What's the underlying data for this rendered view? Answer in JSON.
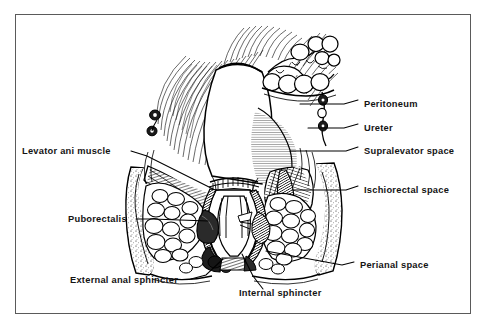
{
  "figure": {
    "border_color": "#5a5a5a",
    "background_color": "#ffffff",
    "ink_color": "#000000"
  },
  "labels": {
    "peritoneum": "Peritoneum",
    "ureter": "Ureter",
    "supralevator_space": "Supralevator space",
    "ischiorectal_space": "Ischiorectal  space",
    "perianal_space": "Perianal space",
    "levator_ani_muscle": "Levator ani muscle",
    "puborectalis": "Puborectalis",
    "external_anal_sphincter": "External anal sphincter",
    "internal_sphincter": "Internal sphincter"
  },
  "label_layout": [
    {
      "key": "peritoneum",
      "side": "right",
      "text_x": 364,
      "text_y": 103,
      "leader": "M 358 100 L 344 104 L 300 104"
    },
    {
      "key": "ureter",
      "side": "right",
      "text_x": 364,
      "text_y": 127,
      "leader": "M 358 124 L 344 128 L 306 128"
    },
    {
      "key": "supralevator_space",
      "side": "right",
      "text_x": 364,
      "text_y": 150,
      "leader": "M 358 147 L 346 151 L 291 151"
    },
    {
      "key": "ischiorectal_space",
      "side": "right",
      "text_x": 364,
      "text_y": 189,
      "leader": "M 358 186 L 346 190 L 293 190"
    },
    {
      "key": "perianal_space",
      "side": "right",
      "text_x": 360,
      "text_y": 265,
      "leader": "M 354 262 L 342 265 L 265 251"
    },
    {
      "key": "levator_ani_muscle",
      "side": "left",
      "text_x": 22,
      "text_y": 154,
      "leader": "M 131 151 L 146 155 L 212 187"
    },
    {
      "key": "puborectalis",
      "side": "left",
      "text_x": 68,
      "text_y": 222,
      "leader": "M 135 219 L 152 219 L 209 219"
    },
    {
      "key": "external_anal_sphincter",
      "side": "bottom-left",
      "text_x": 70,
      "text_y": 283,
      "leader": "M 192 279 L 205 276 L 222 260"
    },
    {
      "key": "internal_sphincter",
      "side": "bottom-right",
      "text_x": 239,
      "text_y": 296,
      "leader": "M 262 289 L 252 277 L 241 255"
    }
  ],
  "anatomy_parts": [
    "rectum-ampulla",
    "anal-canal",
    "columns-of-morgagni",
    "internal-anal-sphincter",
    "external-anal-sphincter",
    "levator-ani-muscle",
    "puborectalis-sling",
    "ischial-bone-left",
    "ischial-bone-right",
    "ischiorectal-fat-left",
    "ischiorectal-fat-right",
    "perianal-fat",
    "peritoneal-reflection",
    "ureter-vessel",
    "perineal-skin"
  ]
}
